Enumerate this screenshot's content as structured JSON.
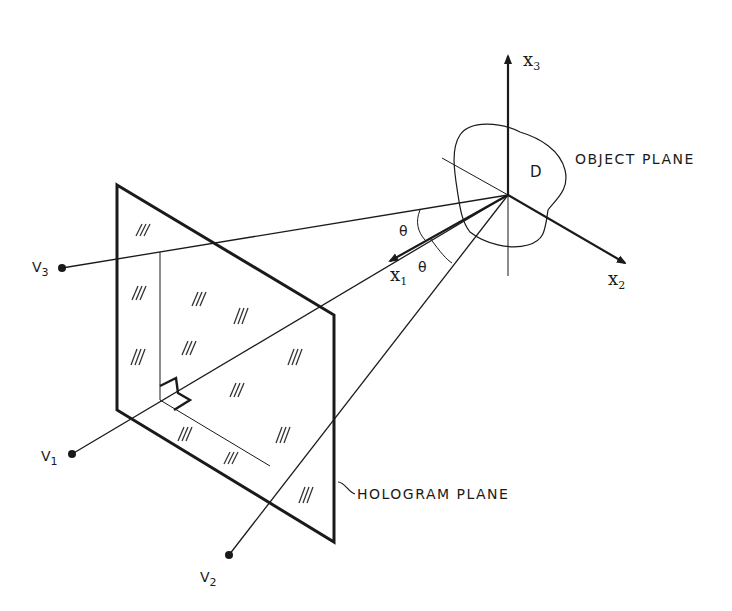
{
  "figure": {
    "type": "geometry-diagram"
  },
  "labels": {
    "object_plane": "OBJECT PLANE",
    "hologram_plane": "HOLOGRAM PLANE",
    "region": "D",
    "theta_upper": "θ",
    "theta_lower": "θ"
  },
  "axes": {
    "x1": {
      "symbol": "x",
      "sub": "1"
    },
    "x2": {
      "symbol": "x",
      "sub": "2"
    },
    "x3": {
      "symbol": "x",
      "sub": "3"
    }
  },
  "points": {
    "v1": {
      "symbol": "V",
      "sub": "1"
    },
    "v2": {
      "symbol": "V",
      "sub": "2"
    },
    "v3": {
      "symbol": "V",
      "sub": "3"
    }
  },
  "colors": {
    "ink": "#1a1a1a",
    "background": "#ffffff"
  }
}
